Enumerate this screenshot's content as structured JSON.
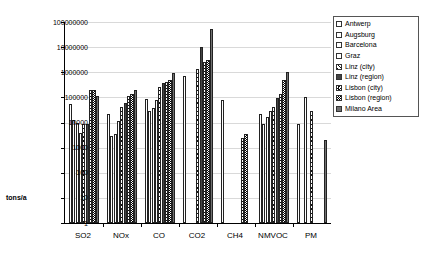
{
  "chart_data": {
    "type": "bar",
    "title": "",
    "subtitle": "",
    "xlabel": "",
    "ylabel": "tons/a",
    "yscale": "log",
    "ylim": [
      1,
      100000000
    ],
    "yticks": [
      1,
      10,
      100,
      1000,
      10000,
      100000,
      1000000,
      10000000,
      100000000
    ],
    "ytick_labels": [
      "1",
      "10",
      "100",
      "1000",
      "10000",
      "100000",
      "1000000",
      "10000000",
      "100000000"
    ],
    "grid": true,
    "legend_position": "top-right",
    "categories": [
      "SO2",
      "NOx",
      "CO",
      "CO2",
      "CH4",
      "NMVOC",
      "PM"
    ],
    "series": [
      {
        "name": "Antwerp",
        "pattern": "open-white",
        "values": [
          55000,
          22000,
          90000,
          700000,
          80000,
          22000,
          9000
        ]
      },
      {
        "name": "Augsburg",
        "pattern": "fine-dots",
        "values": [
          13000,
          3000,
          30000,
          null,
          null,
          9000,
          null
        ]
      },
      {
        "name": "Barcelona",
        "pattern": "horizontal-lines",
        "values": [
          9500,
          3500,
          38000,
          null,
          null,
          17000,
          100000
        ]
      },
      {
        "name": "Graz",
        "pattern": "light-dots",
        "values": [
          4000,
          11000,
          80000,
          null,
          null,
          30000,
          null
        ]
      },
      {
        "name": "Linz (city)",
        "pattern": "diagonal-hatch",
        "values": [
          9000,
          40000,
          270000,
          1300000,
          null,
          40000,
          30000
        ]
      },
      {
        "name": "Linz (region)",
        "pattern": "dense-dots",
        "values": [
          9000,
          60000,
          380000,
          10000000,
          null,
          95000,
          null
        ]
      },
      {
        "name": "Lisbon (city)",
        "pattern": "checkerboard",
        "values": [
          190000,
          115000,
          400000,
          2500000,
          2500,
          140000,
          null
        ]
      },
      {
        "name": "Lisbon (region)",
        "pattern": "dark-checker",
        "values": [
          200000,
          140000,
          500000,
          3000000,
          3500,
          500000,
          null
        ]
      },
      {
        "name": "Milano Area",
        "pattern": "cross-dots",
        "values": [
          110000,
          200000,
          900000,
          55000000,
          null,
          1000000,
          2000
        ]
      }
    ]
  },
  "legend": {
    "items": [
      {
        "label": "Antwerp",
        "swatch": "open-white"
      },
      {
        "label": "Augsburg",
        "swatch": "fine-dots"
      },
      {
        "label": "Barcelona",
        "swatch": "horizontal-lines"
      },
      {
        "label": "Graz",
        "swatch": "light-dots"
      },
      {
        "label": "Linz (city)",
        "swatch": "diagonal-hatch"
      },
      {
        "label": "Linz (region)",
        "swatch": "dense-dots"
      },
      {
        "label": "Lisbon (city)",
        "swatch": "checkerboard"
      },
      {
        "label": "Lisbon (region)",
        "swatch": "dark-checker"
      },
      {
        "label": "Milano Area",
        "swatch": "cross-dots"
      }
    ]
  },
  "colors": {
    "axis": "#000000",
    "grid": "#d9d9d9",
    "background": "#ffffff",
    "legend_border": "#555555"
  }
}
